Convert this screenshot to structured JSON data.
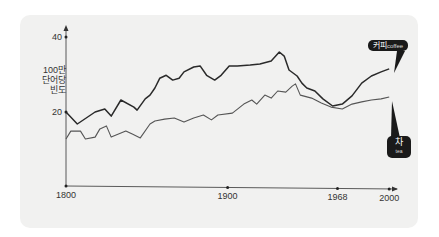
{
  "chart_data": {
    "type": "line",
    "title": "",
    "xlabel": "",
    "ylabel": [
      "100만",
      "단어당",
      "빈도"
    ],
    "xlim": [
      1800,
      2005
    ],
    "ylim": [
      0,
      40
    ],
    "x_ticks": [
      1800,
      1900,
      1968,
      2000
    ],
    "y_ticks": [
      20,
      40
    ],
    "grid": false,
    "series": [
      {
        "name": "coffee",
        "label_kr": "커피",
        "label_en": "coffee",
        "color": "#2a2a2a",
        "points": [
          [
            1800,
            20
          ],
          [
            1807,
            16.8
          ],
          [
            1818,
            20
          ],
          [
            1824,
            20.8
          ],
          [
            1828,
            18.9
          ],
          [
            1834,
            23.2
          ],
          [
            1842,
            21.3
          ],
          [
            1844,
            20.5
          ],
          [
            1849,
            23.5
          ],
          [
            1852,
            24.5
          ],
          [
            1855,
            26.4
          ],
          [
            1858,
            29
          ],
          [
            1862,
            29.8
          ],
          [
            1866,
            28.5
          ],
          [
            1870,
            29
          ],
          [
            1873,
            30.7
          ],
          [
            1879,
            32
          ],
          [
            1883,
            32.3
          ],
          [
            1887,
            29.8
          ],
          [
            1892,
            28.5
          ],
          [
            1896,
            29.8
          ],
          [
            1901,
            32.3
          ],
          [
            1906,
            32.3
          ],
          [
            1914,
            32.5
          ],
          [
            1920,
            32.8
          ],
          [
            1927,
            33.6
          ],
          [
            1932,
            36
          ],
          [
            1935,
            34.9
          ],
          [
            1938,
            31.2
          ],
          [
            1943,
            29.6
          ],
          [
            1946,
            27.7
          ],
          [
            1949,
            26.4
          ],
          [
            1954,
            25.6
          ],
          [
            1959,
            23.5
          ],
          [
            1965,
            21.6
          ],
          [
            1971,
            22.1
          ],
          [
            1977,
            24.3
          ],
          [
            1983,
            27.7
          ],
          [
            1989,
            29.6
          ],
          [
            1995,
            30.7
          ],
          [
            2000,
            31.5
          ]
        ]
      },
      {
        "name": "tea",
        "label_kr": "차",
        "label_en": "tea",
        "color": "#555555",
        "points": [
          [
            1800,
            12.8
          ],
          [
            1803,
            14.9
          ],
          [
            1809,
            14.9
          ],
          [
            1812,
            12.8
          ],
          [
            1818,
            13.3
          ],
          [
            1821,
            15.5
          ],
          [
            1825,
            16.3
          ],
          [
            1828,
            13.3
          ],
          [
            1837,
            14.9
          ],
          [
            1841,
            14.1
          ],
          [
            1846,
            13.1
          ],
          [
            1852,
            16.8
          ],
          [
            1855,
            17.6
          ],
          [
            1861,
            18.1
          ],
          [
            1867,
            18.4
          ],
          [
            1873,
            17.3
          ],
          [
            1879,
            18.4
          ],
          [
            1885,
            19.2
          ],
          [
            1890,
            17.9
          ],
          [
            1894,
            19.2
          ],
          [
            1903,
            19.7
          ],
          [
            1910,
            22.1
          ],
          [
            1915,
            23.2
          ],
          [
            1918,
            22.1
          ],
          [
            1923,
            24.5
          ],
          [
            1927,
            23.7
          ],
          [
            1931,
            25.6
          ],
          [
            1936,
            25.3
          ],
          [
            1940,
            26.9
          ],
          [
            1942,
            27.5
          ],
          [
            1945,
            24.5
          ],
          [
            1952,
            23.7
          ],
          [
            1958,
            22.4
          ],
          [
            1964,
            21.3
          ],
          [
            1971,
            20.8
          ],
          [
            1977,
            22.1
          ],
          [
            1983,
            22.7
          ],
          [
            1989,
            23.2
          ],
          [
            1995,
            23.5
          ],
          [
            2000,
            24.0
          ]
        ]
      }
    ]
  }
}
